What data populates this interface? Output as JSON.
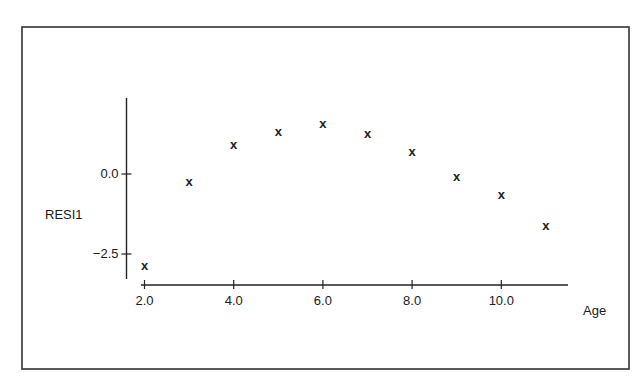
{
  "chart_data": {
    "type": "scatter",
    "title": "",
    "xlabel": "Age",
    "ylabel": "RESI1",
    "marker": "x",
    "x": [
      2,
      3,
      4,
      5,
      6,
      7,
      8,
      9,
      10,
      11
    ],
    "y": [
      -2.88,
      -0.25,
      0.91,
      1.31,
      1.56,
      1.25,
      0.69,
      -0.09,
      -0.66,
      -1.63
    ],
    "series": [
      {
        "name": "RESI1",
        "x": [
          2,
          3,
          4,
          5,
          6,
          7,
          8,
          9,
          10,
          11
        ],
        "values": [
          -2.88,
          -0.25,
          0.91,
          1.31,
          1.56,
          1.25,
          0.69,
          -0.09,
          -0.66,
          -1.63
        ]
      }
    ],
    "x_ticks": [
      2.0,
      4.0,
      6.0,
      8.0,
      10.0
    ],
    "x_tick_labels": [
      "2.0",
      "4.0",
      "6.0",
      "8.0",
      "10.0"
    ],
    "y_ticks": [
      0.0,
      -2.5
    ],
    "y_tick_labels": [
      "0.0",
      "−2.5"
    ],
    "xlim": [
      1.9,
      11.5
    ],
    "ylim": [
      -3.3,
      2.4
    ],
    "grid": false,
    "legend": null
  },
  "layout": {
    "frame": {
      "left": 22,
      "top": 27,
      "right": 629,
      "bottom": 369
    },
    "x_axis": {
      "y_px": 285,
      "x_start_px": 141,
      "x_end_px": 568,
      "origin_value": 2.0,
      "origin_px": 144.5,
      "px_per_unit": 44.6
    },
    "y_axis": {
      "x_px": 126.5,
      "y_top_px": 98,
      "y_bottom_px": 279,
      "zero_px": 174,
      "px_per_unit": 32
    },
    "colors": {
      "ink": "#222222",
      "frame": "#333333",
      "background": "#ffffff"
    }
  }
}
